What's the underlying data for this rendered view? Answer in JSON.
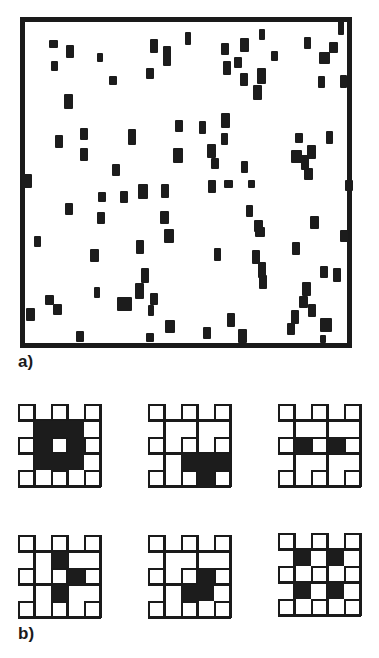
{
  "figure": {
    "panel_a": {
      "label": "a)",
      "frame": {
        "x": 20,
        "y": 17,
        "w": 332,
        "h": 331,
        "border": 5
      },
      "blob_color": "#1c1c1c",
      "blobs": [
        [
          49,
          40,
          9,
          8
        ],
        [
          66,
          45,
          8,
          13
        ],
        [
          51,
          61,
          7,
          10
        ],
        [
          97,
          53,
          6,
          9
        ],
        [
          109,
          76,
          8,
          9
        ],
        [
          150,
          39,
          8,
          14
        ],
        [
          146,
          68,
          8,
          11
        ],
        [
          163,
          46,
          8,
          20
        ],
        [
          64,
          94,
          9,
          15
        ],
        [
          55,
          135,
          8,
          13
        ],
        [
          80,
          128,
          8,
          12
        ],
        [
          128,
          129,
          8,
          16
        ],
        [
          80,
          148,
          8,
          13
        ],
        [
          175,
          120,
          8,
          12
        ],
        [
          173,
          148,
          10,
          15
        ],
        [
          112,
          164,
          8,
          12
        ],
        [
          22,
          174,
          10,
          14
        ],
        [
          185,
          32,
          6,
          13
        ],
        [
          221,
          43,
          8,
          12
        ],
        [
          240,
          38,
          9,
          14
        ],
        [
          234,
          57,
          8,
          11
        ],
        [
          223,
          61,
          8,
          14
        ],
        [
          259,
          29,
          6,
          11
        ],
        [
          240,
          73,
          8,
          13
        ],
        [
          257,
          68,
          9,
          16
        ],
        [
          253,
          85,
          9,
          15
        ],
        [
          271,
          51,
          7,
          10
        ],
        [
          304,
          37,
          7,
          12
        ],
        [
          329,
          42,
          9,
          11
        ],
        [
          319,
          52,
          11,
          12
        ],
        [
          318,
          76,
          7,
          12
        ],
        [
          340,
          75,
          7,
          13
        ],
        [
          338,
          21,
          6,
          14
        ],
        [
          199,
          121,
          7,
          13
        ],
        [
          221,
          113,
          9,
          15
        ],
        [
          221,
          133,
          7,
          12
        ],
        [
          207,
          144,
          9,
          14
        ],
        [
          211,
          158,
          8,
          11
        ],
        [
          241,
          161,
          7,
          12
        ],
        [
          295,
          133,
          8,
          10
        ],
        [
          326,
          131,
          7,
          13
        ],
        [
          291,
          150,
          11,
          13
        ],
        [
          307,
          145,
          9,
          14
        ],
        [
          301,
          155,
          8,
          15
        ],
        [
          304,
          168,
          9,
          12
        ],
        [
          23,
          180,
          8,
          7
        ],
        [
          65,
          203,
          8,
          12
        ],
        [
          97,
          212,
          8,
          12
        ],
        [
          98,
          192,
          8,
          10
        ],
        [
          120,
          191,
          8,
          12
        ],
        [
          138,
          184,
          10,
          15
        ],
        [
          161,
          184,
          8,
          14
        ],
        [
          160,
          211,
          9,
          13
        ],
        [
          164,
          229,
          10,
          14
        ],
        [
          34,
          236,
          7,
          11
        ],
        [
          90,
          249,
          9,
          13
        ],
        [
          136,
          240,
          8,
          14
        ],
        [
          141,
          268,
          8,
          15
        ],
        [
          135,
          283,
          9,
          16
        ],
        [
          94,
          287,
          6,
          11
        ],
        [
          45,
          295,
          9,
          10
        ],
        [
          53,
          304,
          9,
          11
        ],
        [
          117,
          297,
          15,
          14
        ],
        [
          150,
          293,
          8,
          12
        ],
        [
          165,
          320,
          10,
          13
        ],
        [
          148,
          305,
          6,
          11
        ],
        [
          26,
          308,
          9,
          13
        ],
        [
          76,
          331,
          8,
          11
        ],
        [
          146,
          333,
          8,
          9
        ],
        [
          208,
          180,
          8,
          13
        ],
        [
          224,
          180,
          9,
          8
        ],
        [
          248,
          180,
          7,
          8
        ],
        [
          345,
          180,
          8,
          11
        ],
        [
          246,
          205,
          7,
          12
        ],
        [
          254,
          220,
          9,
          12
        ],
        [
          255,
          227,
          10,
          10
        ],
        [
          310,
          216,
          9,
          13
        ],
        [
          340,
          230,
          8,
          12
        ],
        [
          292,
          242,
          8,
          13
        ],
        [
          214,
          248,
          7,
          13
        ],
        [
          252,
          250,
          8,
          14
        ],
        [
          258,
          262,
          8,
          16
        ],
        [
          259,
          275,
          8,
          14
        ],
        [
          320,
          266,
          8,
          12
        ],
        [
          333,
          268,
          8,
          14
        ],
        [
          302,
          282,
          9,
          14
        ],
        [
          299,
          296,
          9,
          12
        ],
        [
          308,
          304,
          8,
          13
        ],
        [
          291,
          310,
          8,
          14
        ],
        [
          287,
          323,
          8,
          12
        ],
        [
          320,
          318,
          12,
          14
        ],
        [
          227,
          313,
          8,
          14
        ],
        [
          203,
          327,
          8,
          12
        ],
        [
          238,
          329,
          9,
          14
        ],
        [
          320,
          335,
          6,
          8
        ]
      ]
    },
    "panel_b": {
      "label": "b)",
      "cell_size": 16.5,
      "patterns": [
        {
          "x": 18,
          "y": 404,
          "filled_rects": [
            [
              1,
              1,
              3,
              3
            ]
          ]
        },
        {
          "x": 148,
          "y": 404,
          "filled_rects": [
            [
              2,
              3,
              3,
              2
            ]
          ]
        },
        {
          "x": 278,
          "y": 404,
          "filled_rects": [
            [
              1,
              2,
              4,
              1
            ]
          ]
        },
        {
          "x": 18,
          "y": 535,
          "filled_rects": [
            [
              2,
              1,
              1,
              1
            ],
            [
              3,
              2,
              1,
              1
            ],
            [
              2,
              3,
              1,
              1
            ]
          ]
        },
        {
          "x": 148,
          "y": 535,
          "filled_rects": [
            [
              2,
              2,
              2,
              2
            ]
          ]
        },
        {
          "x": 278,
          "y": 533,
          "filled_rects": [
            [
              1,
              1,
              1,
              1
            ],
            [
              3,
              1,
              1,
              1
            ],
            [
              1,
              3,
              1,
              1
            ],
            [
              3,
              3,
              1,
              1
            ]
          ]
        }
      ]
    }
  }
}
